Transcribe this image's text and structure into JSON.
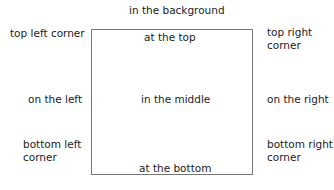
{
  "diagram": {
    "box_border_color": "#777777",
    "labels": {
      "background": "in the background",
      "top_left": "top left corner",
      "top": "at the top",
      "top_right_1": "top right",
      "top_right_2": "corner",
      "left": "on the left",
      "middle": "in the middle",
      "right": "on the right",
      "bottom_left_1": "bottom left",
      "bottom_left_2": "corner",
      "bottom": "at the bottom",
      "bottom_right_1": "bottom right",
      "bottom_right_2": "corner"
    }
  }
}
